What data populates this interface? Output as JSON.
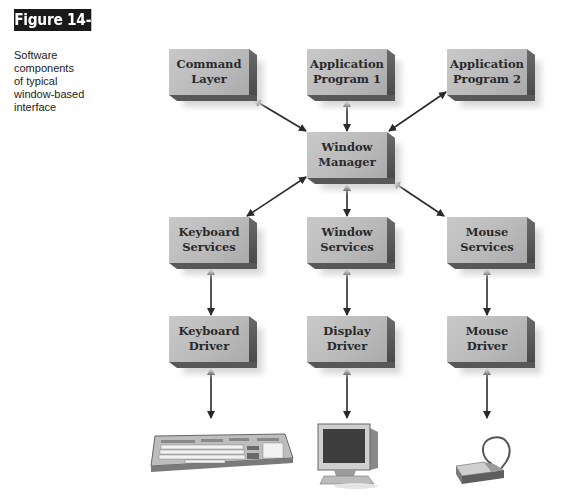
{
  "figure": {
    "tag": "Figure 14-3",
    "caption": "Software\ncomponents\nof typical\nwindow-based\ninterface"
  },
  "diagram": {
    "title": "Software components of typical window-based interface",
    "nodes": [
      {
        "id": "command-layer",
        "label": "Command\nLayer"
      },
      {
        "id": "application-program-1",
        "label": "Application\nProgram 1"
      },
      {
        "id": "application-program-2",
        "label": "Application\nProgram 2"
      },
      {
        "id": "window-manager",
        "label": "Window\nManager"
      },
      {
        "id": "keyboard-services",
        "label": "Keyboard\nServices"
      },
      {
        "id": "window-services",
        "label": "Window\nServices"
      },
      {
        "id": "mouse-services",
        "label": "Mouse\nServices"
      },
      {
        "id": "keyboard-driver",
        "label": "Keyboard\nDriver"
      },
      {
        "id": "display-driver",
        "label": "Display\nDriver"
      },
      {
        "id": "mouse-driver",
        "label": "Mouse\nDriver"
      }
    ],
    "devices": [
      {
        "id": "keyboard",
        "icon": "keyboard-icon"
      },
      {
        "id": "monitor",
        "icon": "monitor-icon"
      },
      {
        "id": "mouse",
        "icon": "mouse-icon"
      }
    ],
    "edges": [
      {
        "from": "command-layer",
        "to": "window-manager",
        "type": "bidirectional"
      },
      {
        "from": "application-program-1",
        "to": "window-manager",
        "type": "bidirectional"
      },
      {
        "from": "application-program-2",
        "to": "window-manager",
        "type": "bidirectional"
      },
      {
        "from": "window-manager",
        "to": "keyboard-services",
        "type": "bidirectional"
      },
      {
        "from": "window-manager",
        "to": "window-services",
        "type": "bidirectional"
      },
      {
        "from": "window-manager",
        "to": "mouse-services",
        "type": "bidirectional"
      },
      {
        "from": "keyboard-services",
        "to": "keyboard-driver",
        "type": "bidirectional"
      },
      {
        "from": "window-services",
        "to": "display-driver",
        "type": "bidirectional"
      },
      {
        "from": "mouse-services",
        "to": "mouse-driver",
        "type": "bidirectional"
      },
      {
        "from": "keyboard-driver",
        "to": "keyboard",
        "type": "bidirectional"
      },
      {
        "from": "display-driver",
        "to": "monitor",
        "type": "bidirectional"
      },
      {
        "from": "mouse-driver",
        "to": "mouse",
        "type": "bidirectional"
      }
    ],
    "colors": {
      "box_face": "#bdbdbd",
      "box_side": "#555555",
      "arrow": "#2a2a2a",
      "tag_bg": "#1a1a1a"
    }
  }
}
